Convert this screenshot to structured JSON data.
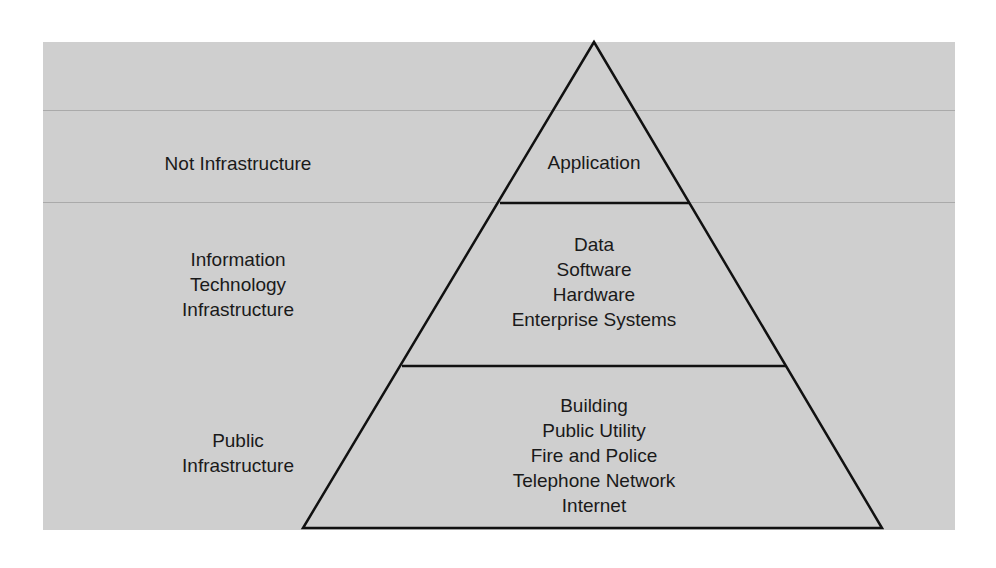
{
  "diagram": {
    "type": "pyramid",
    "colors": {
      "background": "#cfcfcf",
      "lines": "#111111",
      "text": "#1a1a1a",
      "rules": "#aaaaaa"
    },
    "side_labels": [
      {
        "text": "Not Infrastructure"
      },
      {
        "text": "Information\nTechnology\nInfrastructure"
      },
      {
        "text": "Public\nInfrastructure"
      }
    ],
    "tiers": [
      {
        "name": "top",
        "text": "Application"
      },
      {
        "name": "middle",
        "text": "Data\nSoftware\nHardware\nEnterprise Systems"
      },
      {
        "name": "bottom",
        "text": "Building\nPublic Utility\nFire and Police\nTelephone Network\nInternet"
      }
    ]
  }
}
